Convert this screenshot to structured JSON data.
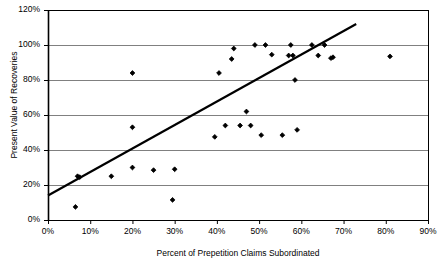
{
  "chart_data": {
    "type": "scatter",
    "title": "",
    "xlabel": "Percent of Prepetition Claims Subordinated",
    "ylabel": "Present Value of Recoveries",
    "xlim": [
      0,
      90
    ],
    "ylim": [
      0,
      120
    ],
    "xticks": [
      0,
      10,
      20,
      30,
      40,
      50,
      60,
      70,
      80,
      90
    ],
    "yticks": [
      0,
      20,
      40,
      60,
      80,
      100,
      120
    ],
    "xtick_labels": [
      "0%",
      "10%",
      "20%",
      "30%",
      "40%",
      "50%",
      "60%",
      "70%",
      "80%",
      "90%"
    ],
    "ytick_labels": [
      "0%",
      "20%",
      "40%",
      "60%",
      "80%",
      "100%",
      "120%"
    ],
    "grid": "horizontal",
    "legend": "none",
    "marker": "diamond",
    "marker_color": "#000000",
    "gridline_color": "#808080",
    "axis_color": "#000000",
    "trendline_color": "#000000",
    "points": [
      {
        "x": 6.5,
        "y": 7.5
      },
      {
        "x": 7.0,
        "y": 25.0
      },
      {
        "x": 7.5,
        "y": 24.5
      },
      {
        "x": 15.0,
        "y": 25.0
      },
      {
        "x": 20.0,
        "y": 84.0
      },
      {
        "x": 20.0,
        "y": 53.0
      },
      {
        "x": 20.0,
        "y": 30.0
      },
      {
        "x": 25.0,
        "y": 28.5
      },
      {
        "x": 29.5,
        "y": 11.5
      },
      {
        "x": 30.0,
        "y": 29.0
      },
      {
        "x": 39.5,
        "y": 47.5
      },
      {
        "x": 40.5,
        "y": 84.0
      },
      {
        "x": 42.0,
        "y": 54.0
      },
      {
        "x": 43.5,
        "y": 92.0
      },
      {
        "x": 44.0,
        "y": 98.0
      },
      {
        "x": 45.5,
        "y": 54.0
      },
      {
        "x": 47.0,
        "y": 62.0
      },
      {
        "x": 48.0,
        "y": 54.0
      },
      {
        "x": 49.0,
        "y": 100.0
      },
      {
        "x": 50.5,
        "y": 48.5
      },
      {
        "x": 51.5,
        "y": 100.0
      },
      {
        "x": 53.0,
        "y": 94.5
      },
      {
        "x": 55.5,
        "y": 48.5
      },
      {
        "x": 57.5,
        "y": 100.0
      },
      {
        "x": 57.0,
        "y": 94.0
      },
      {
        "x": 58.0,
        "y": 94.0
      },
      {
        "x": 58.5,
        "y": 80.0
      },
      {
        "x": 59.0,
        "y": 51.5
      },
      {
        "x": 62.5,
        "y": 100.0
      },
      {
        "x": 64.0,
        "y": 94.0
      },
      {
        "x": 65.5,
        "y": 100.0
      },
      {
        "x": 67.0,
        "y": 92.5
      },
      {
        "x": 67.5,
        "y": 93.0
      },
      {
        "x": 81.0,
        "y": 93.5
      }
    ],
    "trendline": {
      "x0": 0,
      "y0": 14.0,
      "x1": 73.0,
      "y1": 112.0
    }
  }
}
